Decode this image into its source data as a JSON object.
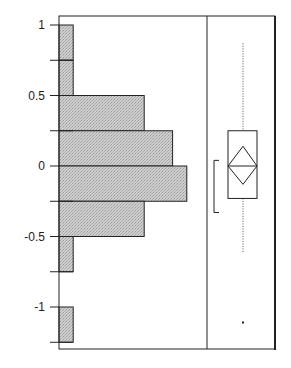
{
  "chart_data": {
    "type": "bar",
    "subtype": "histogram_with_outlier_boxplot",
    "title": "",
    "title_note": "title cut off at top edge, not legible",
    "orientation": "horizontal",
    "xlabel": "",
    "ylabel": "",
    "ylim": [
      -1.25,
      1.1
    ],
    "ytick_labels": [
      "1",
      "0.5",
      "0",
      "-0.5",
      "-1"
    ],
    "yticks": [
      1,
      0.75,
      0.5,
      0.25,
      0,
      -0.25,
      -0.5,
      -0.75,
      -1,
      -1.25
    ],
    "grid": false,
    "bins": [
      {
        "from": 0.75,
        "to": 1.0,
        "count": 1
      },
      {
        "from": 0.5,
        "to": 0.75,
        "count": 1
      },
      {
        "from": 0.25,
        "to": 0.5,
        "count": 6
      },
      {
        "from": 0.0,
        "to": 0.25,
        "count": 8
      },
      {
        "from": -0.25,
        "to": 0.0,
        "count": 9
      },
      {
        "from": -0.5,
        "to": -0.25,
        "count": 6
      },
      {
        "from": -0.75,
        "to": -0.5,
        "count": 1
      },
      {
        "from": -1.0,
        "to": -0.75,
        "count": 0
      },
      {
        "from": -1.25,
        "to": -1.0,
        "count": 1
      }
    ],
    "boxplot": {
      "upper_whisker": 0.87,
      "q3": 0.25,
      "median": 0.0,
      "q1": -0.23,
      "lower_whisker": -0.62,
      "mean_diamond": {
        "top": 0.14,
        "center": 0.0,
        "bottom": -0.13
      },
      "shortest_half_bracket": {
        "top": 0.04,
        "bottom": -0.33
      },
      "outliers": [
        -1.11
      ]
    },
    "colors": {
      "bar_fill": "#c4c4c4",
      "stroke": "#222222",
      "background": "#ffffff"
    }
  }
}
